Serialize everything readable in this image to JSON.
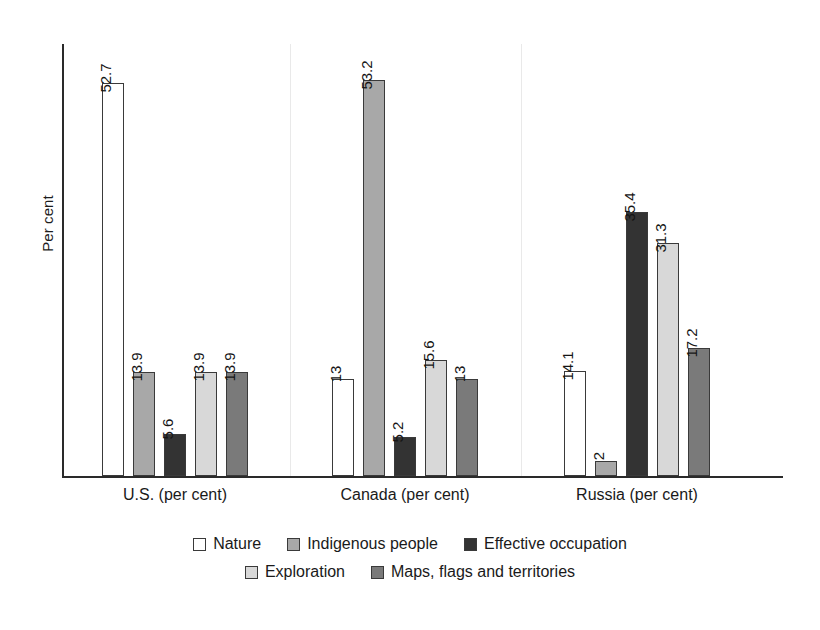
{
  "chart_data": {
    "type": "bar",
    "title": "",
    "subtitle": "",
    "xlabel": "",
    "ylabel": "Per cent",
    "categories": [
      "U.S. (per cent)",
      "Canada (per cent)",
      "Russia (per cent)"
    ],
    "series": [
      {
        "name": "Nature",
        "color": "#ffffff",
        "values": [
          52.7,
          13,
          14.1
        ]
      },
      {
        "name": "Indigenous people",
        "color": "#a8a8a8",
        "values": [
          13.9,
          53.2,
          2
        ]
      },
      {
        "name": "Effective occupation",
        "color": "#333333",
        "values": [
          5.6,
          5.2,
          35.4
        ]
      },
      {
        "name": "Exploration",
        "color": "#d8d8d8",
        "values": [
          13.9,
          15.6,
          31.3
        ]
      },
      {
        "name": "Maps, flags and territories",
        "color": "#7a7a7a",
        "values": [
          13.9,
          13,
          17.2
        ]
      }
    ],
    "value_labels": {
      "U.S. (per cent)": [
        "52.7",
        "13.9",
        "5.6",
        "13.9",
        "13.9"
      ],
      "Canada (per cent)": [
        "13",
        "53.2",
        "5.2",
        "15.6",
        "13"
      ],
      "Russia (per cent)": [
        "14.1",
        "2",
        "35.4",
        "31.3",
        "17.2"
      ]
    },
    "ylim": [
      0,
      58
    ],
    "grid": false,
    "legend_position": "bottom",
    "axis_color": "#2a2a2a",
    "separator_color": "#e9e9e9",
    "bar_border_color": "#3a3a3a"
  },
  "legend": {
    "rows": [
      [
        {
          "label": "Nature",
          "color": "#ffffff"
        },
        {
          "label": "Indigenous people",
          "color": "#a8a8a8"
        },
        {
          "label": "Effective occupation",
          "color": "#333333"
        }
      ],
      [
        {
          "label": "Exploration",
          "color": "#d8d8d8"
        },
        {
          "label": "Maps, flags and territories",
          "color": "#7a7a7a"
        }
      ]
    ]
  }
}
